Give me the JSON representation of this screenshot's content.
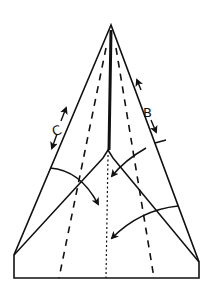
{
  "diagram": {
    "type": "paper-airplane-folding-step",
    "stroke_color": "#111111",
    "background": "#ffffff",
    "labels": {
      "c": "C",
      "b": "B"
    },
    "elements": {
      "outline": "kite-shaped paper outline with flat bottom edge",
      "center_crease": "center fold line (solid from apex, dotted below)",
      "fold_lines": "two diagonal creases from center junction to bottom corners",
      "dashed_folds": "two dashed valley-fold lines",
      "arrows": "two curved fold arrows and two double-headed edge arrows"
    }
  }
}
